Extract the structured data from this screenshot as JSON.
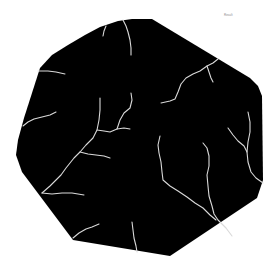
{
  "image": {
    "description": "Black octagonal segmentation mask with thin light-gray crack/vein lines on a white background",
    "background_color": "#ffffff",
    "mask_color": "#000000",
    "crack_color": "#d9d9d9",
    "corner_label": "Result"
  },
  "mask": {
    "outline": "40,68 52,55 68,45 85,35 100,27 118,21 132,19 152,19 250,78 258,86 262,96 263,180 257,198 170,256 73,240 40,196 22,172 16,155 18,140 24,118"
  },
  "cracks": [
    {
      "name": "crack-top-center",
      "points": "123,20 126,26 128,32 130,40 131,48 131,55"
    },
    {
      "name": "crack-top-left-short",
      "points": "106,26 104,31 103,36"
    },
    {
      "name": "crack-left-horizontal",
      "points": "38,71 48,71 56,72 65,74"
    },
    {
      "name": "crack-main-diagonal",
      "points": "100,98 100,110 99,120 97,130 93,138 86,145 80,152 74,158 70,163 66,168 61,175 56,180 50,186 42,193"
    },
    {
      "name": "crack-main-branch-right",
      "points": "97,130 104,131 110,132 117,129 124,128 130,129"
    },
    {
      "name": "crack-main-branch-up",
      "points": "117,129 120,120 124,113 130,108 132,100 131,93"
    },
    {
      "name": "crack-main-branch-mid",
      "points": "80,152 88,154 96,155 104,156 110,158"
    },
    {
      "name": "crack-main-branch-low",
      "points": "42,193 52,194 62,193 72,193 84,195"
    },
    {
      "name": "crack-left-lower",
      "points": "23,126 28,122 34,119 42,117 50,115 56,112"
    },
    {
      "name": "crack-bottom-left",
      "points": "73,238 79,233 86,229 92,227 99,224"
    },
    {
      "name": "crack-bottom-center",
      "points": "132,222 133,230 134,238 136,246 137,252"
    },
    {
      "name": "crack-upper-right",
      "points": "218,59 213,63 207,66 200,71 193,74 186,78 181,84 178,92 175,99 170,101 161,103"
    },
    {
      "name": "crack-upper-right-branch",
      "points": "207,66 209,72 211,78 213,82"
    },
    {
      "name": "crack-center-right-a",
      "points": "160,136 158,145 159,153 161,162 162,172 163,180 170,186 178,191 187,197 195,203 203,208 210,215 216,220"
    },
    {
      "name": "crack-center-right-b",
      "points": "203,143 207,148 209,156 209,166 207,175 208,186 209,196 212,206 214,214 218,220 226,228 232,236"
    },
    {
      "name": "crack-far-right",
      "points": "248,112 250,122 250,132 248,142 247,152 248,162 251,172 256,178 263,183"
    },
    {
      "name": "crack-far-right-branch",
      "points": "228,128 233,135 238,141 244,146 247,152"
    }
  ]
}
